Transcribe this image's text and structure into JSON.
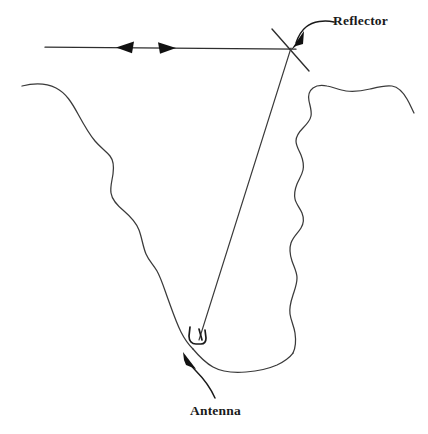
{
  "figure": {
    "background_color": "#ffffff",
    "ink_color": "#2e2e2e",
    "label_color": "#1a1a1a",
    "width": 428,
    "height": 434
  },
  "labels": {
    "reflector": "Reflector",
    "antenna": "Antenna"
  },
  "icons": {
    "reflector_callout": "arrow-icon",
    "antenna_callout": "arrow-icon",
    "ray_left_arrow": "arrowhead-left-icon",
    "ray_right_arrow": "arrowhead-right-icon"
  },
  "geometry": {
    "horizontal_ray": {
      "x1": 45,
      "y1": 47,
      "x2": 296,
      "y2": 49
    },
    "ray_arrow_left_tip_x": 116,
    "ray_arrow_right_tip_x": 176,
    "reflector_point": {
      "x": 290,
      "y": 48
    },
    "antenna_point": {
      "x": 198,
      "y": 341
    },
    "reflector_bar": {
      "x1": 272,
      "y1": 29,
      "x2": 308,
      "y2": 70
    },
    "beam": {
      "from": "reflector_point",
      "to": "antenna_point"
    }
  }
}
